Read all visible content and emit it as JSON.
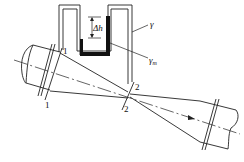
{
  "diagram": {
    "labels": {
      "section1_top": "1",
      "section1_bottom": "1",
      "section2_top": "2",
      "section2_bottom": "2",
      "fluid_weight": "γ",
      "manometer_fluid_weight": "γ",
      "manometer_fluid_sub": "m",
      "height_difference": "Δh"
    },
    "colors": {
      "line": "#222222",
      "manometer_liquid": "#111111",
      "background": "#ffffff"
    }
  }
}
